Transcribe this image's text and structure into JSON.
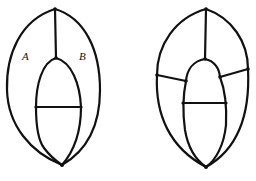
{
  "figures": [
    {
      "id": "left-graph",
      "regions": [
        {
          "label": "A",
          "x": 22,
          "y": 60
        },
        {
          "label": "B",
          "x": 79,
          "y": 60
        }
      ],
      "vertex_count": 5
    },
    {
      "id": "right-graph",
      "regions": [],
      "vertex_count": 9
    }
  ],
  "colors": {
    "stroke": "#111111",
    "background": "#ffffff"
  }
}
